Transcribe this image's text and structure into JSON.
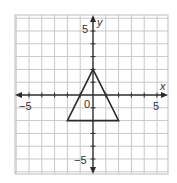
{
  "chart_data": {
    "type": "line",
    "title": "",
    "xlabel": "x",
    "ylabel": "y",
    "xlim": [
      -6.1,
      5.9
    ],
    "ylim": [
      -6.2,
      6.25
    ],
    "grid": true,
    "x_ticks": [
      -5,
      5
    ],
    "y_ticks": [
      5,
      -5
    ],
    "origin_label": "0",
    "series": [
      {
        "name": "triangle",
        "closed": true,
        "points": [
          [
            0,
            2
          ],
          [
            2,
            -2
          ],
          [
            -2,
            -2
          ]
        ]
      }
    ]
  },
  "labels": {
    "x_axis": "x",
    "y_axis": "y",
    "origin": "0",
    "x_neg5": "−5",
    "x_pos5": "5",
    "y_pos5": "5",
    "y_neg5": "−5"
  },
  "colors": {
    "grid": "#c8c8c8",
    "border": "#bdbdbd",
    "axis": "#2b2b2b",
    "shape": "#2b2b2b"
  }
}
